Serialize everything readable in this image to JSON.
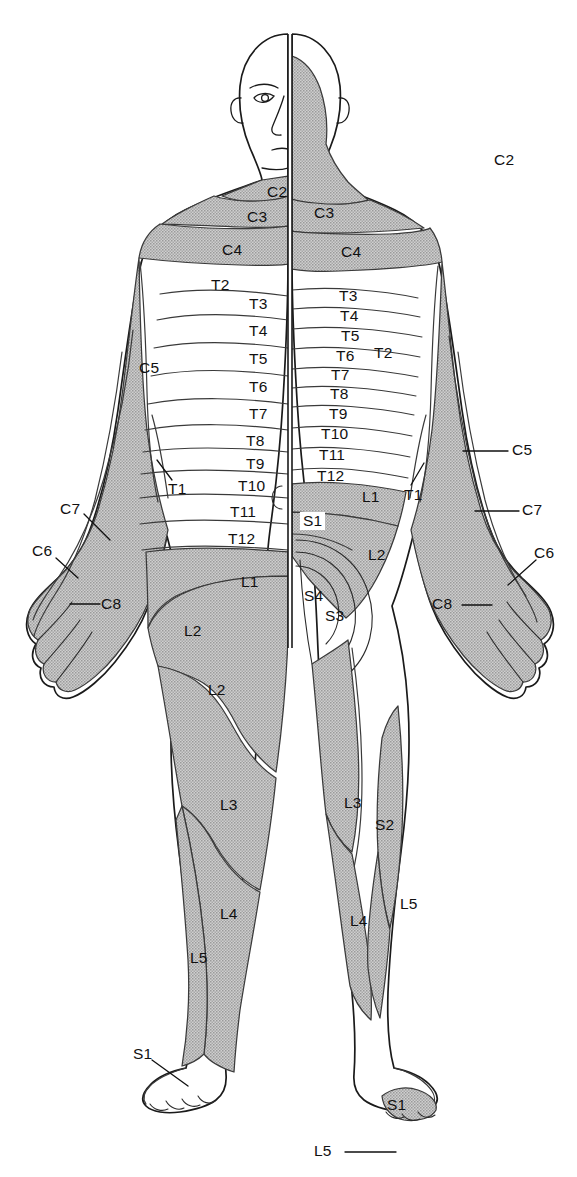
{
  "figure": {
    "view_left": "anterior",
    "view_right": "posterior",
    "colors": {
      "shaded_dermatome": "#b3b3b3",
      "outline": "#1a1a1a",
      "background": "#ffffff",
      "label_text": "#111111"
    }
  },
  "labels": {
    "head_neck": [
      {
        "id": "c2-posterior",
        "text": "C2",
        "x": 494,
        "y": 152
      },
      {
        "id": "c2-anterior",
        "text": "C2",
        "x": 267,
        "y": 184
      },
      {
        "id": "c3-anterior",
        "text": "C3",
        "x": 262,
        "y": 210
      },
      {
        "id": "c3-posterior",
        "text": "C3",
        "x": 314,
        "y": 205
      },
      {
        "id": "c4-anterior",
        "text": "C4",
        "x": 226,
        "y": 243
      },
      {
        "id": "c4-posterior",
        "text": "C4",
        "x": 341,
        "y": 247
      }
    ],
    "trunk_anterior": [
      {
        "id": "t2-left",
        "text": "T2",
        "x": 215,
        "y": 283
      },
      {
        "id": "t3-left",
        "text": "T3",
        "x": 249,
        "y": 299
      },
      {
        "id": "t4-left",
        "text": "T4",
        "x": 249,
        "y": 325
      },
      {
        "id": "t5-left",
        "text": "T5",
        "x": 249,
        "y": 353
      },
      {
        "id": "t6-left",
        "text": "T6",
        "x": 249,
        "y": 381
      },
      {
        "id": "t7-left",
        "text": "T7",
        "x": 249,
        "y": 409
      },
      {
        "id": "t8-left",
        "text": "T8",
        "x": 248,
        "y": 437
      },
      {
        "id": "t9-left",
        "text": "T9",
        "x": 248,
        "y": 460
      },
      {
        "id": "t10-left",
        "text": "T10",
        "x": 240,
        "y": 482
      },
      {
        "id": "t11-left",
        "text": "T11",
        "x": 232,
        "y": 508
      },
      {
        "id": "t12-left",
        "text": "T12",
        "x": 230,
        "y": 535
      },
      {
        "id": "l1-left",
        "text": "L1",
        "x": 243,
        "y": 578
      },
      {
        "id": "l2-left",
        "text": "L2",
        "x": 186,
        "y": 627
      }
    ],
    "trunk_posterior": [
      {
        "id": "t3-right",
        "text": "T3",
        "x": 339,
        "y": 296
      },
      {
        "id": "t4-right",
        "text": "T4",
        "x": 340,
        "y": 315
      },
      {
        "id": "t5-right",
        "text": "T5",
        "x": 341,
        "y": 336
      },
      {
        "id": "t6-right",
        "text": "T6",
        "x": 336,
        "y": 356
      },
      {
        "id": "t7-right",
        "text": "T7",
        "x": 331,
        "y": 375
      },
      {
        "id": "t8-right",
        "text": "T8",
        "x": 330,
        "y": 394
      },
      {
        "id": "t9-right",
        "text": "T9",
        "x": 329,
        "y": 413
      },
      {
        "id": "t10-right",
        "text": "T10",
        "x": 324,
        "y": 434
      },
      {
        "id": "t11-right",
        "text": "T11",
        "x": 322,
        "y": 455
      },
      {
        "id": "t12-right",
        "text": "T12",
        "x": 320,
        "y": 476
      },
      {
        "id": "l1-right",
        "text": "L1",
        "x": 364,
        "y": 494
      },
      {
        "id": "s1-sacral",
        "text": "S1",
        "x": 303,
        "y": 518,
        "boxed": true
      },
      {
        "id": "l2-right",
        "text": "L2",
        "x": 370,
        "y": 551
      },
      {
        "id": "s4-sacral",
        "text": "S4",
        "x": 306,
        "y": 592
      },
      {
        "id": "s3-sacral",
        "text": "S3",
        "x": 327,
        "y": 612
      }
    ],
    "arms": [
      {
        "id": "c5-left",
        "text": "C5",
        "x": 142,
        "y": 365
      },
      {
        "id": "t1-left",
        "text": "T1",
        "x": 174,
        "y": 487
      },
      {
        "id": "c7-left",
        "text": "C7",
        "x": 63,
        "y": 506
      },
      {
        "id": "c6-left",
        "text": "C6",
        "x": 41,
        "y": 547
      },
      {
        "id": "c8-left",
        "text": "C8",
        "x": 103,
        "y": 599
      },
      {
        "id": "t2-right",
        "text": "T2",
        "x": 376,
        "y": 351
      },
      {
        "id": "c5-right",
        "text": "C5",
        "x": 512,
        "y": 446
      },
      {
        "id": "t1-right",
        "text": "T1",
        "x": 409,
        "y": 491
      },
      {
        "id": "c7-right",
        "text": "C7",
        "x": 523,
        "y": 506
      },
      {
        "id": "c6-right",
        "text": "C6",
        "x": 537,
        "y": 549
      },
      {
        "id": "c8-right",
        "text": "C8",
        "x": 435,
        "y": 600
      }
    ],
    "legs": [
      {
        "id": "l2-thigh-left",
        "text": "L2",
        "x": 211,
        "y": 687
      },
      {
        "id": "l3-left",
        "text": "L3",
        "x": 222,
        "y": 802
      },
      {
        "id": "l4-left",
        "text": "L4",
        "x": 222,
        "y": 911
      },
      {
        "id": "l5-left",
        "text": "L5",
        "x": 194,
        "y": 955
      },
      {
        "id": "s1-foot-left",
        "text": "S1",
        "x": 138,
        "y": 1050
      },
      {
        "id": "l3-right",
        "text": "L3",
        "x": 345,
        "y": 800
      },
      {
        "id": "s2-right",
        "text": "S2",
        "x": 377,
        "y": 821
      },
      {
        "id": "l4-right",
        "text": "L4",
        "x": 353,
        "y": 918
      },
      {
        "id": "l5-right-calf",
        "text": "L5",
        "x": 403,
        "y": 900
      },
      {
        "id": "s1-foot-right",
        "text": "S1",
        "x": 390,
        "y": 1102
      },
      {
        "id": "l5-foot-right",
        "text": "L5",
        "x": 318,
        "y": 1146
      }
    ]
  },
  "dermatome_levels": [
    "C2",
    "C3",
    "C4",
    "C5",
    "C6",
    "C7",
    "C8",
    "T1",
    "T2",
    "T3",
    "T4",
    "T5",
    "T6",
    "T7",
    "T8",
    "T9",
    "T10",
    "T11",
    "T12",
    "L1",
    "L2",
    "L3",
    "L4",
    "L5",
    "S1",
    "S2",
    "S3",
    "S4"
  ]
}
